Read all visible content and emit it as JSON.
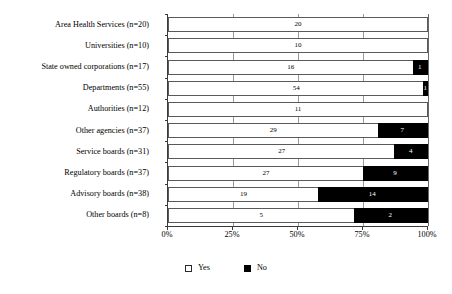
{
  "chart_data": {
    "type": "bar",
    "orientation": "horizontal",
    "stacked": true,
    "stacked_mode": "percent",
    "title": "",
    "subtitle": "",
    "xlabel": "",
    "ylabel": "",
    "xlim": [
      0,
      100
    ],
    "grid": true,
    "legend_position": "bottom",
    "xticks": [
      "0%",
      "25%",
      "50%",
      "75%",
      "100%"
    ],
    "xtick_values": [
      0,
      25,
      50,
      75,
      100
    ],
    "categories": [
      "Area Health Services (n=20)",
      "Universities (n=10)",
      "State owned corporations (n=17)",
      "Departments (n=55)",
      "Authorities (n=12)",
      "Other agencies (n=37)",
      "Service boards (n=31)",
      "Regulatory boards (n=37)",
      "Advisory boards (n=38)",
      "Other boards (n=8)"
    ],
    "series": [
      {
        "name": "Yes",
        "color": "#ffffff",
        "values": [
          20,
          10,
          16,
          54,
          11,
          29,
          27,
          27,
          19,
          5
        ]
      },
      {
        "name": "No",
        "color": "#000000",
        "values": [
          0,
          0,
          1,
          1,
          0,
          7,
          4,
          9,
          14,
          2
        ]
      }
    ],
    "totals": [
      20,
      10,
      17,
      55,
      12,
      37,
      31,
      37,
      38,
      8
    ],
    "rows": [
      {
        "category": "Area Health Services (n=20)",
        "total": 20,
        "yes": 20,
        "no": 0,
        "yes_label": "20",
        "no_label": "",
        "yes_pct": 100.0,
        "no_pct": 0.0
      },
      {
        "category": "Universities (n=10)",
        "total": 10,
        "yes": 10,
        "no": 0,
        "yes_label": "10",
        "no_label": "",
        "yes_pct": 100.0,
        "no_pct": 0.0
      },
      {
        "category": "State owned corporations (n=17)",
        "total": 17,
        "yes": 16,
        "no": 1,
        "yes_label": "16",
        "no_label": "1",
        "yes_pct": 94.1,
        "no_pct": 5.9
      },
      {
        "category": "Departments (n=55)",
        "total": 55,
        "yes": 54,
        "no": 1,
        "yes_label": "54",
        "no_label": "1",
        "yes_pct": 98.2,
        "no_pct": 1.8
      },
      {
        "category": "Authorities (n=12)",
        "total": 12,
        "yes": 11,
        "no": 0,
        "yes_label": "11",
        "no_label": "",
        "yes_pct": 100.0,
        "no_pct": 0.0
      },
      {
        "category": "Other agencies (n=37)",
        "total": 36,
        "yes": 29,
        "no": 7,
        "yes_label": "29",
        "no_label": "7",
        "yes_pct": 80.6,
        "no_pct": 19.4
      },
      {
        "category": "Service boards (n=31)",
        "total": 31,
        "yes": 27,
        "no": 4,
        "yes_label": "27",
        "no_label": "4",
        "yes_pct": 87.1,
        "no_pct": 12.9
      },
      {
        "category": "Regulatory boards (n=37)",
        "total": 36,
        "yes": 27,
        "no": 9,
        "yes_label": "27",
        "no_label": "9",
        "yes_pct": 75.0,
        "no_pct": 25.0
      },
      {
        "category": "Advisory boards (n=38)",
        "total": 33,
        "yes": 19,
        "no": 14,
        "yes_label": "19",
        "no_label": "14",
        "yes_pct": 57.6,
        "no_pct": 42.4
      },
      {
        "category": "Other boards (n=8)",
        "total": 7,
        "yes": 5,
        "no": 2,
        "yes_label": "5",
        "no_label": "2",
        "yes_pct": 71.4,
        "no_pct": 28.6
      }
    ]
  },
  "legend": {
    "items": [
      {
        "label": "Yes",
        "swatch": "open-square",
        "color": "#ffffff"
      },
      {
        "label": "No",
        "swatch": "filled-square",
        "color": "#000000"
      }
    ]
  }
}
